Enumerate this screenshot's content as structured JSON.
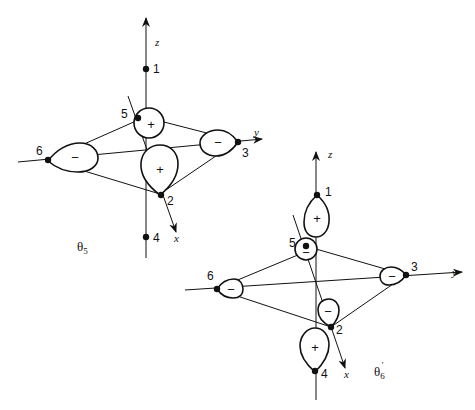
{
  "diagrams": [
    {
      "id": "theta5",
      "title": "θ",
      "subscript": "5",
      "prime": "",
      "axes": {
        "x": "x",
        "y": "y",
        "z": "z"
      },
      "nodes": [
        {
          "id": "1",
          "label": "1"
        },
        {
          "id": "2",
          "label": "2",
          "lobe_sign": "+"
        },
        {
          "id": "3",
          "label": "3",
          "lobe_sign": "−"
        },
        {
          "id": "4",
          "label": "4"
        },
        {
          "id": "5",
          "label": "5",
          "lobe_sign": "+"
        },
        {
          "id": "6",
          "label": "6",
          "lobe_sign": "−"
        }
      ]
    },
    {
      "id": "theta6prime",
      "title": "θ",
      "subscript": "6",
      "prime": "'",
      "axes": {
        "x": "x",
        "y": "y",
        "z": "z"
      },
      "nodes": [
        {
          "id": "1",
          "label": "1",
          "lobe_sign": "+"
        },
        {
          "id": "2",
          "label": "2",
          "lobe_sign": "−"
        },
        {
          "id": "3",
          "label": "3",
          "lobe_sign": "−"
        },
        {
          "id": "4",
          "label": "4",
          "lobe_sign": "+"
        },
        {
          "id": "5",
          "label": "5",
          "lobe_sign": "−"
        },
        {
          "id": "6",
          "label": "6",
          "lobe_sign": "−"
        }
      ]
    }
  ]
}
